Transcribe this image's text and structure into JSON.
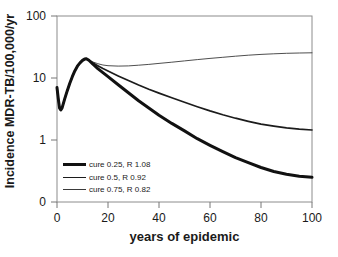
{
  "colors": {
    "frame": "#8c8c8c",
    "tick": "#777777",
    "text": "#1a1a1a",
    "background": "#ffffff"
  },
  "axes": {
    "y_title": "Incidence MDR-TB/100,000/yr",
    "x_title": "years of epidemic",
    "y_ticks": [
      "100",
      "10",
      "1",
      "0"
    ],
    "x_ticks": [
      "0",
      "20",
      "40",
      "60",
      "80",
      "100"
    ]
  },
  "chart_data": {
    "type": "line",
    "title": "",
    "xlabel": "years of epidemic",
    "ylabel": "Incidence MDR-TB/100,000/yr",
    "x_range": [
      0,
      100
    ],
    "y_scale": "log",
    "y_range": [
      0.1,
      100
    ],
    "x_ticks": [
      0,
      20,
      40,
      60,
      80,
      100
    ],
    "y_ticks": [
      100,
      10,
      1,
      0.1
    ],
    "y_tick_labels": [
      "100",
      "10",
      "1",
      "0"
    ],
    "grid": false,
    "legend_position": "inside-bottom-left",
    "series": [
      {
        "name": "cure 0.25, R 1.08",
        "line_width": 3,
        "color": "#111111",
        "points": [
          [
            0,
            7
          ],
          [
            0.5,
            4.6
          ],
          [
            1,
            3.3
          ],
          [
            1.5,
            3.05
          ],
          [
            2,
            3.3
          ],
          [
            3,
            4.6
          ],
          [
            4,
            6.2
          ],
          [
            5,
            8.2
          ],
          [
            6,
            10.5
          ],
          [
            7,
            13
          ],
          [
            8,
            15.5
          ],
          [
            9,
            17.6
          ],
          [
            10,
            19.2
          ],
          [
            11,
            20.3
          ],
          [
            11.5,
            20.5
          ],
          [
            12.5,
            19.3
          ],
          [
            14,
            16.8
          ],
          [
            16,
            14.2
          ],
          [
            18,
            12.2
          ],
          [
            20,
            10.5
          ],
          [
            24,
            7.8
          ],
          [
            28,
            5.8
          ],
          [
            32,
            4.3
          ],
          [
            36,
            3.3
          ],
          [
            40,
            2.5
          ],
          [
            45,
            1.85
          ],
          [
            50,
            1.4
          ],
          [
            55,
            1.05
          ],
          [
            60,
            0.82
          ],
          [
            65,
            0.65
          ],
          [
            70,
            0.52
          ],
          [
            75,
            0.43
          ],
          [
            80,
            0.36
          ],
          [
            85,
            0.31
          ],
          [
            90,
            0.28
          ],
          [
            95,
            0.26
          ],
          [
            100,
            0.25
          ]
        ]
      },
      {
        "name": "cure 0.5, R 0.92",
        "line_width": 1.7,
        "color": "#1c1c1c",
        "points": [
          [
            0,
            7
          ],
          [
            0.5,
            4.6
          ],
          [
            1,
            3.3
          ],
          [
            1.5,
            3.05
          ],
          [
            2,
            3.3
          ],
          [
            3,
            4.6
          ],
          [
            4,
            6.2
          ],
          [
            5,
            8.2
          ],
          [
            6,
            10.5
          ],
          [
            7,
            13
          ],
          [
            8,
            15.5
          ],
          [
            9,
            17.6
          ],
          [
            10,
            19.2
          ],
          [
            11,
            20.3
          ],
          [
            11.5,
            20.5
          ],
          [
            12.5,
            19.4
          ],
          [
            14,
            17.6
          ],
          [
            16,
            15.8
          ],
          [
            18,
            14.2
          ],
          [
            20,
            12.9
          ],
          [
            24,
            10.8
          ],
          [
            28,
            9.1
          ],
          [
            32,
            7.7
          ],
          [
            36,
            6.6
          ],
          [
            40,
            5.7
          ],
          [
            45,
            4.8
          ],
          [
            50,
            4.05
          ],
          [
            55,
            3.45
          ],
          [
            60,
            2.95
          ],
          [
            65,
            2.55
          ],
          [
            70,
            2.25
          ],
          [
            75,
            2.0
          ],
          [
            80,
            1.8
          ],
          [
            85,
            1.67
          ],
          [
            90,
            1.57
          ],
          [
            95,
            1.5
          ],
          [
            100,
            1.45
          ]
        ]
      },
      {
        "name": "cure 0.75, R 0.82",
        "line_width": 0.9,
        "color": "#3a3a3a",
        "points": [
          [
            0,
            7
          ],
          [
            0.5,
            4.6
          ],
          [
            1,
            3.3
          ],
          [
            1.5,
            3.05
          ],
          [
            2,
            3.3
          ],
          [
            3,
            4.6
          ],
          [
            4,
            6.2
          ],
          [
            5,
            8.2
          ],
          [
            6,
            10.5
          ],
          [
            7,
            13
          ],
          [
            8,
            15.5
          ],
          [
            9,
            17.6
          ],
          [
            10,
            19.2
          ],
          [
            11,
            20.3
          ],
          [
            11.5,
            20.5
          ],
          [
            12.5,
            19.5
          ],
          [
            14,
            18.2
          ],
          [
            16,
            17.0
          ],
          [
            18,
            16.2
          ],
          [
            20,
            15.8
          ],
          [
            24,
            15.55
          ],
          [
            28,
            15.65
          ],
          [
            32,
            16.1
          ],
          [
            36,
            16.6
          ],
          [
            40,
            17.2
          ],
          [
            45,
            18.0
          ],
          [
            50,
            18.9
          ],
          [
            55,
            19.8
          ],
          [
            60,
            20.7
          ],
          [
            65,
            21.6
          ],
          [
            70,
            22.5
          ],
          [
            75,
            23.3
          ],
          [
            80,
            24.0
          ],
          [
            85,
            24.6
          ],
          [
            90,
            25.0
          ],
          [
            95,
            25.3
          ],
          [
            100,
            25.5
          ]
        ]
      }
    ]
  }
}
